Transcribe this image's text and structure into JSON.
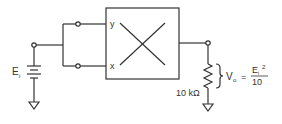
{
  "diagram": {
    "block": {
      "name": "multiplier",
      "input_y": "y",
      "input_x": "x"
    },
    "source": {
      "label_main": "E",
      "label_sub": "i"
    },
    "resistor": {
      "label": "10 kΩ"
    },
    "output": {
      "label_main": "V",
      "label_sub": "o",
      "equals": "=",
      "numerator_main": "E",
      "numerator_sub": "i",
      "numerator_exp": "2",
      "denominator": "10"
    },
    "colors": {
      "line": "#333333",
      "background": "#ffffff"
    }
  }
}
